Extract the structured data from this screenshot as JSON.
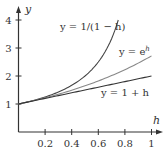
{
  "chart_data": {
    "type": "line",
    "title": "",
    "xlabel": "h",
    "ylabel": "y",
    "xlim": [
      0,
      1.02
    ],
    "ylim": [
      0,
      4.3
    ],
    "x_ticks": [
      0.2,
      0.4,
      0.6,
      0.8,
      1
    ],
    "x_tick_labels": [
      "0.2",
      "0.4",
      "0.6",
      "0.8",
      "1"
    ],
    "y_ticks": [
      1,
      2,
      3,
      4
    ],
    "y_tick_labels": [
      "1",
      "2",
      "3",
      "4"
    ],
    "grid": false,
    "legend": "inline labels",
    "series": [
      {
        "name": "y = 1/(1 − h)",
        "label_text": "y = 1/(1 − h)",
        "color": "#444444",
        "x": [
          0,
          0.1,
          0.2,
          0.3,
          0.4,
          0.5,
          0.6,
          0.65,
          0.7,
          0.75
        ],
        "values": [
          1,
          1.111,
          1.25,
          1.429,
          1.667,
          2.0,
          2.5,
          2.857,
          3.333,
          4.0
        ]
      },
      {
        "name": "y = e^h",
        "label_text": "y = e",
        "label_sup": "h",
        "color": "#888888",
        "x": [
          0,
          0.2,
          0.4,
          0.6,
          0.8,
          1.0
        ],
        "values": [
          1,
          1.221,
          1.492,
          1.822,
          2.226,
          2.718
        ]
      },
      {
        "name": "y = 1 + h",
        "label_text": "y = 1 + h",
        "color": "#333333",
        "x": [
          0,
          1.0
        ],
        "values": [
          1,
          2
        ]
      }
    ]
  }
}
